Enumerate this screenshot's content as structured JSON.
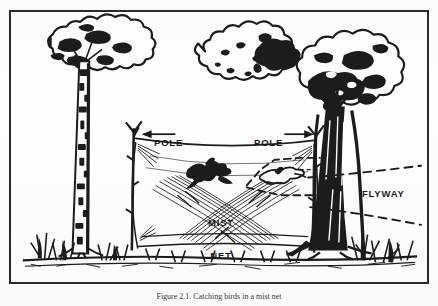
{
  "figure": {
    "caption": "Figure 2.1. Catching birds in a mist net",
    "border_color": "#2b2b2b",
    "ink_color": "#1c1c1c",
    "background_color": "#fefefe",
    "labels": {
      "pole_left": "POLE",
      "pole_right": "POLE",
      "mist_net_line1": "MIST",
      "mist_net_line2": "NET",
      "flyway": "FLYWAY"
    },
    "elements": {
      "tree_left": "birch-tree",
      "tree_middle": "outline-canopy-tree",
      "tree_right": "large-dark-tree",
      "net": "mist-net-mesh",
      "bird_caught": "bird-silhouette",
      "bird_flying": "bird-outline",
      "flyway_paths": "dashed-flight-lines",
      "ground": "grass-ground-line"
    }
  }
}
